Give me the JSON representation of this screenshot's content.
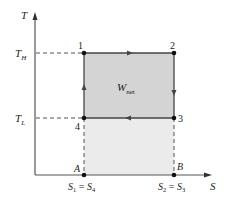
{
  "diagram": {
    "type": "T-S diagram (Carnot cycle)",
    "axes": {
      "y_label": "T",
      "x_label": "S"
    },
    "temperature_levels": {
      "high": {
        "symbol": "T",
        "sub": "H"
      },
      "low": {
        "symbol": "T",
        "sub": "L"
      }
    },
    "states": [
      {
        "id": "1",
        "label": "1"
      },
      {
        "id": "2",
        "label": "2"
      },
      {
        "id": "3",
        "label": "3"
      },
      {
        "id": "4",
        "label": "4"
      }
    ],
    "base_points": {
      "A": "A",
      "B": "B"
    },
    "entropy_labels": {
      "left": {
        "s1": "S",
        "s1_sub": "1",
        "eq": " = ",
        "s4": "S",
        "s4_sub": "4"
      },
      "right": {
        "s2": "S",
        "s2_sub": "2",
        "eq": " = ",
        "s3": "S",
        "s3_sub": "3"
      }
    },
    "work_label": {
      "symbol": "W",
      "sub": "net"
    },
    "colors": {
      "axis": "#555555",
      "cycle_fill": "#d4d4d4",
      "lower_fill": "#ebebeb",
      "line": "#444444",
      "point": "#111111"
    }
  }
}
